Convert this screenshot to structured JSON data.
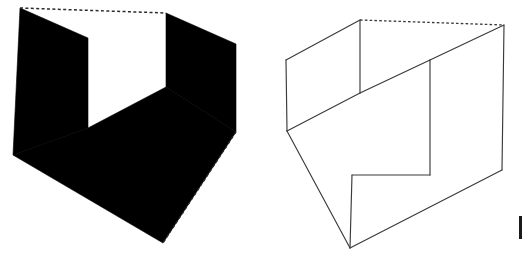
{
  "image": {
    "title": "Stepped surface ambiguous figure pair",
    "width": 526,
    "height": 264,
    "background_color": "#ffffff",
    "description": "Two line-perspective drawings of the same stepped (L-shaped fold) surface: the left rendered as solid black silhouette panels with dotted hidden edges, the right rendered as an open wireframe outline."
  },
  "figures": [
    {
      "id": "left-figure",
      "label": "Left figure",
      "style": "solid-black-fill",
      "fill_color": "#000000",
      "stroke_color": "#1a1a1a",
      "dashed_edge_color": "#2b2b2b",
      "solid_panels": [
        {
          "name": "left-black-panel",
          "points": "20,8 88,38 88,128 13,155"
        },
        {
          "name": "right-black-panel",
          "points": "166,13 236,44 236,132 166,87"
        },
        {
          "name": "floor-black-panel",
          "points": "13,155 88,128 166,87 236,132 163,243"
        }
      ],
      "dashed_edges": [
        {
          "name": "top-hidden-edge",
          "points": "20,8 166,13"
        },
        {
          "name": "lower-right-hidden-edge",
          "points": "236,132 163,243"
        }
      ]
    },
    {
      "id": "right-figure",
      "label": "Right figure",
      "style": "wireframe-outline",
      "fill_color": "none",
      "stroke_color": "#3a3a3a",
      "dashed_edge_color": "#3a3a3a",
      "solid_edges": [
        {
          "name": "left-panel-top-edge",
          "points": "286,60 360,20"
        },
        {
          "name": "left-panel-left-edge",
          "points": "286,60 287,131"
        },
        {
          "name": "left-panel-bottom-edge",
          "points": "287,131 360,93"
        },
        {
          "name": "left-panel-right-edge",
          "points": "360,20 360,93"
        },
        {
          "name": "step-riser-edge",
          "points": "360,93 430,60"
        },
        {
          "name": "inner-vertical-edge",
          "points": "430,60 430,175"
        },
        {
          "name": "step-tread-edge",
          "points": "430,175 352,175"
        },
        {
          "name": "front-lower-vertical-edge",
          "points": "352,175 350,248"
        },
        {
          "name": "floor-left-edge",
          "points": "287,131 350,248"
        },
        {
          "name": "floor-front-edge",
          "points": "350,248 502,170"
        },
        {
          "name": "right-panel-right-edge",
          "points": "504,25 502,170"
        },
        {
          "name": "right-panel-inner-edge",
          "points": "504,25 430,60"
        }
      ],
      "dashed_edges": [
        {
          "name": "top-hidden-edge",
          "points": "360,20 504,25"
        }
      ]
    }
  ],
  "artifacts": [
    {
      "name": "page-edge-mark",
      "description": "Small vertical scan artifact at right margin",
      "x": 519,
      "y": 216,
      "width": 3,
      "height": 23,
      "color": "#1a1a1a"
    }
  ]
}
